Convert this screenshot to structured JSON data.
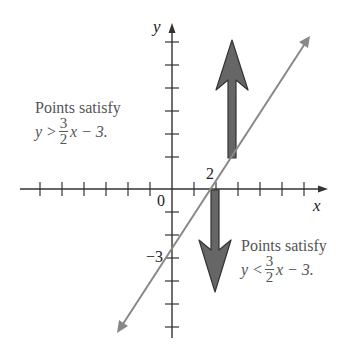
{
  "diagram": {
    "type": "coordinate-plane-inequality",
    "axes": {
      "x_label": "x",
      "y_label": "y",
      "origin_label": "0",
      "x_tick_label": "2",
      "y_tick_label": "−3"
    },
    "line": {
      "equation": "y = (3/2)x − 3",
      "slope": "3/2",
      "y_intercept": -3,
      "x_intercept": 2
    },
    "upper_region": {
      "caption": "Points satisfy",
      "inequality_left": "y >",
      "numerator": "3",
      "denominator": "2",
      "inequality_right": "x − 3."
    },
    "lower_region": {
      "caption": "Points satisfy",
      "inequality_left": "y <",
      "numerator": "3",
      "denominator": "2",
      "inequality_right": "x − 3."
    },
    "colors": {
      "axis": "#333333",
      "line": "#888888",
      "arrow_fill": "#666666",
      "arrow_stroke": "#333333",
      "text": "#555555"
    }
  }
}
